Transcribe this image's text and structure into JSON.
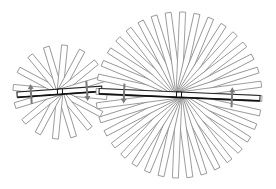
{
  "diagram": {
    "colors": {
      "background": "#ffffff",
      "blade_outline": "#8a8a8a",
      "beam_outline": "#222222",
      "arrow": "#7a7a7a"
    },
    "fans": [
      {
        "name": "small-fan",
        "center": [
          60,
          92
        ],
        "radius": 47,
        "blade_count": 16,
        "blade_width": 6,
        "beam_tilt_deg": -4,
        "beam_from_x": 17,
        "beam_to_x": 102,
        "arrows": [
          {
            "x": 31,
            "direction": "up"
          },
          {
            "x": 87,
            "direction": "down"
          }
        ]
      },
      {
        "name": "large-fan",
        "center": [
          179,
          95
        ],
        "radius": 83,
        "blade_count": 36,
        "blade_width": 6,
        "beam_tilt_deg": 2.5,
        "beam_from_x": 99,
        "beam_to_x": 260,
        "arrows": [
          {
            "x": 124,
            "direction": "down"
          },
          {
            "x": 232,
            "direction": "up"
          }
        ]
      }
    ]
  }
}
